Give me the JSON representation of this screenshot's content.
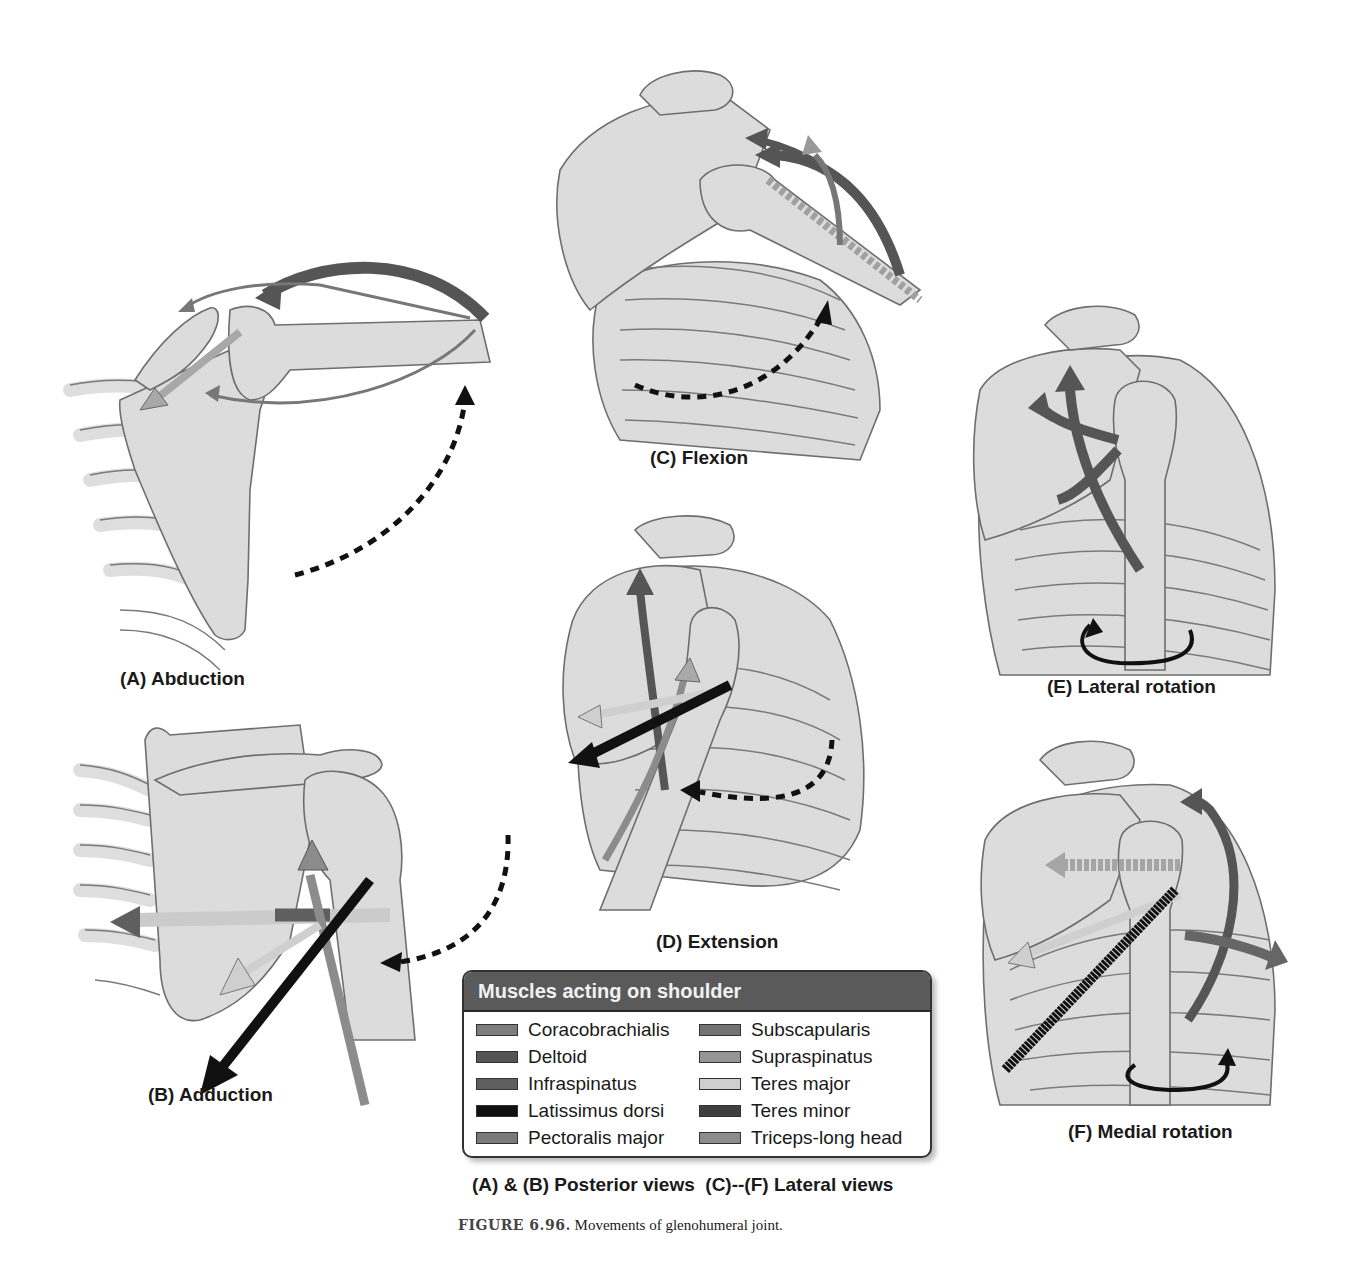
{
  "figure": {
    "number_label": "FIGURE 6.96.",
    "title": "Movements of glenohumeral joint.",
    "views_caption": "(A) & (B) Posterior views  (C)--(F) Lateral views"
  },
  "panels": [
    {
      "id": "A",
      "label": "(A) Abduction"
    },
    {
      "id": "B",
      "label": "(B) Adduction"
    },
    {
      "id": "C",
      "label": "(C) Flexion"
    },
    {
      "id": "D",
      "label": "(D) Extension"
    },
    {
      "id": "E",
      "label": "(E) Lateral rotation"
    },
    {
      "id": "F",
      "label": "(F) Medial rotation"
    }
  ],
  "legend": {
    "title": "Muscles acting on shoulder",
    "items": [
      {
        "name": "Coracobrachialis",
        "color": "#7d7d7d"
      },
      {
        "name": "Deltoid",
        "color": "#555555"
      },
      {
        "name": "Infraspinatus",
        "color": "#5f5f5f"
      },
      {
        "name": "Latissimus dorsi",
        "color": "#111111"
      },
      {
        "name": "Pectoralis major",
        "color": "#7a7a7a"
      },
      {
        "name": "Subscapularis",
        "color": "#737373"
      },
      {
        "name": "Supraspinatus",
        "color": "#969696"
      },
      {
        "name": "Teres major",
        "color": "#cfcfcf"
      },
      {
        "name": "Teres minor",
        "color": "#3f3f3f"
      },
      {
        "name": "Triceps-long head",
        "color": "#8c8c8c"
      }
    ]
  },
  "colors": {
    "bone": "#dcdcdc",
    "outline": "#6e6e6e",
    "movement_arrow": "#111111",
    "legend_header": "#5a5a5a"
  }
}
